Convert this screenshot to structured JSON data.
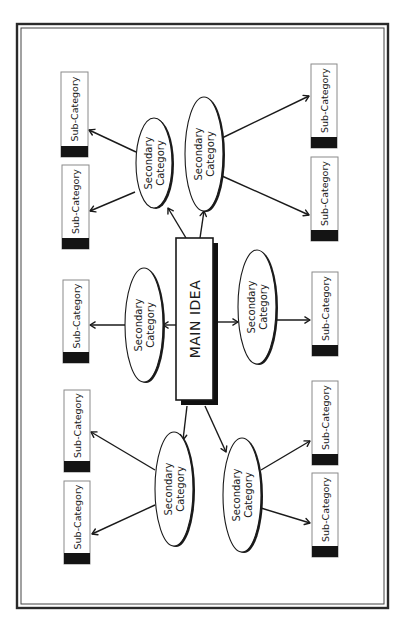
{
  "diagram": {
    "type": "mind-map",
    "orientation": "rotated-90-ccw",
    "frame": {
      "x": 17,
      "y": 24,
      "width": 371,
      "height": 584
    },
    "main_idea": {
      "label": "MAIN IDEA",
      "x": 176,
      "y": 238,
      "width": 37,
      "height": 162
    },
    "secondary_categories": [
      {
        "id": "sec-1",
        "line1": "Secondary",
        "line2": "Category",
        "cx": 154,
        "cy": 163,
        "rx": 18,
        "ry": 45
      },
      {
        "id": "sec-2",
        "line1": "Secondary",
        "line2": "Category",
        "cx": 204,
        "cy": 154,
        "rx": 19,
        "ry": 57
      },
      {
        "id": "sec-3",
        "line1": "Secondary",
        "line2": "Category",
        "cx": 144,
        "cy": 325,
        "rx": 19,
        "ry": 57
      },
      {
        "id": "sec-4",
        "line1": "Secondary",
        "line2": "Category",
        "cx": 257,
        "cy": 307,
        "rx": 19,
        "ry": 57
      },
      {
        "id": "sec-5",
        "line1": "Secondary",
        "line2": "Category",
        "cx": 174,
        "cy": 489,
        "rx": 19,
        "ry": 57
      },
      {
        "id": "sec-6",
        "line1": "Secondary",
        "line2": "Category",
        "cx": 242,
        "cy": 495,
        "rx": 19,
        "ry": 57
      }
    ],
    "sub_categories": [
      {
        "id": "sub-1",
        "label": "Sub-Category",
        "x": 61,
        "y": 72,
        "width": 27,
        "height": 85
      },
      {
        "id": "sub-2",
        "label": "Sub-Category",
        "x": 62,
        "y": 165,
        "width": 27,
        "height": 84
      },
      {
        "id": "sub-3",
        "label": "Sub-Category",
        "x": 63,
        "y": 280,
        "width": 26,
        "height": 83
      },
      {
        "id": "sub-4",
        "label": "Sub-Category",
        "x": 64,
        "y": 390,
        "width": 26,
        "height": 82
      },
      {
        "id": "sub-5",
        "label": "Sub-Category",
        "x": 64,
        "y": 481,
        "width": 26,
        "height": 83
      },
      {
        "id": "sub-6",
        "label": "Sub-Category",
        "x": 311,
        "y": 64,
        "width": 26,
        "height": 84
      },
      {
        "id": "sub-7",
        "label": "Sub-Category",
        "x": 311,
        "y": 157,
        "width": 27,
        "height": 84
      },
      {
        "id": "sub-8",
        "label": "Sub-Category",
        "x": 312,
        "y": 272,
        "width": 26,
        "height": 84
      },
      {
        "id": "sub-9",
        "label": "Sub-Category",
        "x": 312,
        "y": 381,
        "width": 26,
        "height": 84
      },
      {
        "id": "sub-10",
        "label": "Sub-Category",
        "x": 312,
        "y": 473,
        "width": 26,
        "height": 84
      }
    ],
    "connections": [
      {
        "from": "main",
        "to": "sec-1",
        "x1": 186,
        "y1": 238,
        "x2": 168,
        "y2": 208
      },
      {
        "from": "main",
        "to": "sec-2",
        "x1": 200,
        "y1": 238,
        "x2": 204,
        "y2": 211
      },
      {
        "from": "main",
        "to": "sec-3",
        "x1": 176,
        "y1": 325,
        "x2": 163,
        "y2": 325
      },
      {
        "from": "main",
        "to": "sec-4",
        "x1": 218,
        "y1": 322,
        "x2": 238,
        "y2": 322
      },
      {
        "from": "main",
        "to": "sec-5",
        "x1": 187,
        "y1": 406,
        "x2": 183,
        "y2": 440
      },
      {
        "from": "main",
        "to": "sec-6",
        "x1": 205,
        "y1": 406,
        "x2": 226,
        "y2": 452
      },
      {
        "from": "sec-1",
        "to": "sub-1",
        "x1": 136,
        "y1": 152,
        "x2": 89,
        "y2": 130
      },
      {
        "from": "sec-1",
        "to": "sub-2",
        "x1": 135,
        "y1": 192,
        "x2": 90,
        "y2": 211
      },
      {
        "from": "sec-2",
        "to": "sub-6",
        "x1": 222,
        "y1": 138,
        "x2": 309,
        "y2": 96
      },
      {
        "from": "sec-2",
        "to": "sub-7",
        "x1": 222,
        "y1": 176,
        "x2": 309,
        "y2": 215
      },
      {
        "from": "sec-3",
        "to": "sub-3",
        "x1": 125,
        "y1": 325,
        "x2": 90,
        "y2": 325
      },
      {
        "from": "sec-4",
        "to": "sub-8",
        "x1": 276,
        "y1": 320,
        "x2": 310,
        "y2": 320
      },
      {
        "from": "sec-5",
        "to": "sub-4",
        "x1": 155,
        "y1": 470,
        "x2": 91,
        "y2": 432
      },
      {
        "from": "sec-5",
        "to": "sub-5",
        "x1": 155,
        "y1": 505,
        "x2": 92,
        "y2": 534
      },
      {
        "from": "sec-6",
        "to": "sub-9",
        "x1": 261,
        "y1": 470,
        "x2": 310,
        "y2": 441
      },
      {
        "from": "sec-6",
        "to": "sub-10",
        "x1": 261,
        "y1": 508,
        "x2": 310,
        "y2": 523
      }
    ]
  }
}
